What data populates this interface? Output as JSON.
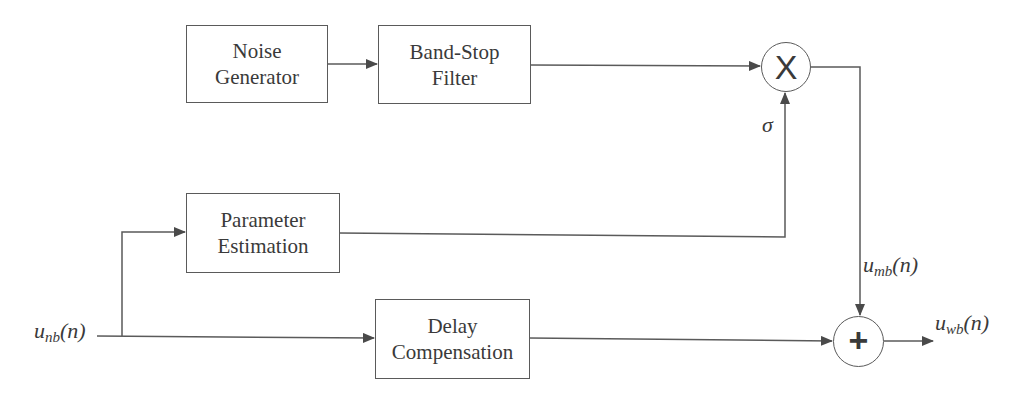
{
  "diagram": {
    "type": "block-diagram",
    "blocks": {
      "noise_generator": {
        "line1": "Noise",
        "line2": "Generator"
      },
      "band_stop_filter": {
        "line1": "Band-Stop",
        "line2": "Filter"
      },
      "parameter_estimation": {
        "line1": "Parameter",
        "line2": "Estimation"
      },
      "delay_compensation": {
        "line1": "Delay",
        "line2": "Compensation"
      }
    },
    "nodes": {
      "multiplier": {
        "symbol": "X",
        "type": "multiplier"
      },
      "summer": {
        "symbol": "+",
        "type": "summing-junction"
      }
    },
    "signals": {
      "input": {
        "base": "u",
        "sub": "nb",
        "arg": "(n)"
      },
      "modulated": {
        "base": "u",
        "sub": "mb",
        "arg": "(n)"
      },
      "output": {
        "base": "u",
        "sub": "wb",
        "arg": "(n)"
      },
      "sigma": "σ"
    },
    "connections": [
      {
        "from": "input",
        "to": "parameter_estimation"
      },
      {
        "from": "input",
        "to": "delay_compensation"
      },
      {
        "from": "noise_generator",
        "to": "band_stop_filter"
      },
      {
        "from": "band_stop_filter",
        "to": "multiplier"
      },
      {
        "from": "parameter_estimation",
        "to": "multiplier",
        "label": "σ"
      },
      {
        "from": "multiplier",
        "to": "summer",
        "label": "u_mb(n)"
      },
      {
        "from": "delay_compensation",
        "to": "summer"
      },
      {
        "from": "summer",
        "to": "output",
        "label": "u_wb(n)"
      }
    ],
    "colors": {
      "line": "#5a5a5a",
      "text": "#3a3a3a",
      "background": "#ffffff"
    }
  }
}
